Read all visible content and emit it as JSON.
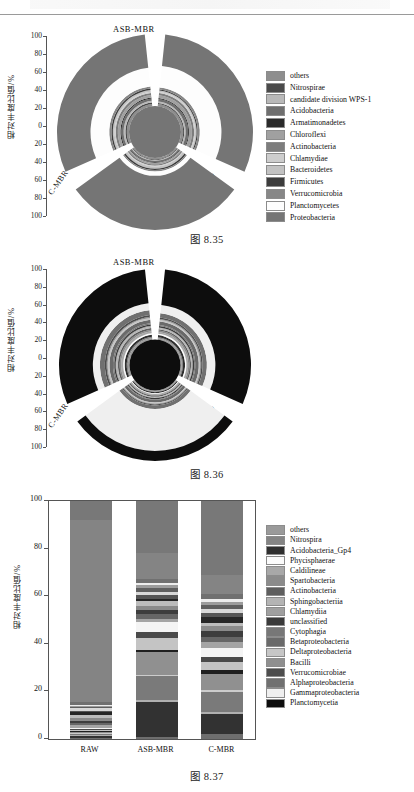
{
  "page": {
    "captions": {
      "fig1": "图 8.35",
      "fig2": "图 8.36",
      "fig3": "图 8.37"
    },
    "axis_title_cn": "相对丰度比值/%"
  },
  "chart_data": [
    {
      "id": "fig-8-35",
      "type": "pie",
      "subtype": "polar-stacked-rose",
      "title": "",
      "ylabel": "相对丰度比值/%",
      "ylim": [
        0,
        100
      ],
      "yticks": [
        "100",
        "80",
        "60",
        "40",
        "20",
        "0",
        "20",
        "40",
        "60",
        "80",
        "100"
      ],
      "sectors": [
        "ASB-MBR",
        "RAW",
        "C-MBR"
      ],
      "legend_position": "right",
      "categories": [
        "others",
        "Nitrospirae",
        "candidate division WPS-1",
        "Acidobacteria",
        "Armatimonadetes",
        "Chloroflexi",
        "Actinobacteria",
        "Chlamydiae",
        "Bacteroidetes",
        "Firmicutes",
        "Verrucomicrobia",
        "Planctomycetes",
        "Proteobacteria"
      ],
      "colors": [
        "#8e8e8e",
        "#4a4a4a",
        "#b9b9b9",
        "#6f6f6f",
        "#2a2a2a",
        "#a0a0a0",
        "#7d7d7d",
        "#cdcdcd",
        "#c2c2c2",
        "#3c3c3c",
        "#878787",
        "#fdfdfd",
        "#757575"
      ],
      "series": [
        {
          "name": "ASB-MBR",
          "values": [
            3.0,
            1.5,
            2.0,
            3.5,
            1.2,
            4.0,
            3.0,
            1.5,
            2.0,
            1.5,
            3.0,
            30.0,
            43.8
          ]
        },
        {
          "name": "RAW",
          "values": [
            2.0,
            1.0,
            1.0,
            2.0,
            0.8,
            2.0,
            2.0,
            1.0,
            3.0,
            2.0,
            2.0,
            6.0,
            75.2
          ]
        },
        {
          "name": "C-MBR",
          "values": [
            3.0,
            2.0,
            2.5,
            3.0,
            1.5,
            3.5,
            3.0,
            1.5,
            2.5,
            2.0,
            3.0,
            26.0,
            46.5
          ]
        }
      ]
    },
    {
      "id": "fig-8-36",
      "type": "pie",
      "subtype": "polar-stacked-rose",
      "title": "",
      "ylabel": "相对丰度比值/%",
      "ylim": [
        0,
        100
      ],
      "yticks": [
        "100",
        "80",
        "60",
        "40",
        "20",
        "0",
        "20",
        "40",
        "60",
        "80",
        "100"
      ],
      "sectors": [
        "ASB-MBR",
        "RAW",
        "C-MBR"
      ],
      "legend_position": "right",
      "categories": [
        "others",
        "Nitrospira",
        "Acidobacteria_Gp4",
        "Phycisphaerae",
        "Caldilineae",
        "Spartobacteria",
        "Actinobacteria",
        "Sphingobacteriia",
        "Chlamydiia",
        "unclassified",
        "Cytophagia",
        "Betaproteobacteria",
        "Deltaproteobacteria",
        "Bacilli",
        "Verrucomicrobiae",
        "Alphaproteobacteria",
        "Gammaproteobacteria",
        "Planctomycetia"
      ],
      "colors": [
        "#9a9a9a",
        "#848484",
        "#2f2f2f",
        "#fbfbfb",
        "#a8a8a8",
        "#8b8b8b",
        "#5e5e5e",
        "#b4b4b4",
        "#9f9f9f",
        "#3a3a3a",
        "#777777",
        "#6a6a6a",
        "#c6c6c6",
        "#8f8f8f",
        "#4d4d4d",
        "#707070",
        "#efefef",
        "#0d0d0d"
      ],
      "series": [
        {
          "name": "ASB-MBR",
          "values": [
            2.0,
            1.5,
            3.0,
            2.0,
            2.5,
            2.0,
            2.0,
            1.5,
            1.0,
            2.0,
            1.5,
            5.0,
            2.0,
            1.5,
            2.0,
            6.0,
            12.0,
            50.5
          ]
        },
        {
          "name": "RAW",
          "values": [
            1.5,
            1.0,
            1.5,
            1.0,
            1.5,
            1.0,
            1.5,
            1.0,
            0.8,
            1.5,
            1.0,
            4.0,
            1.5,
            1.2,
            1.5,
            5.0,
            60.0,
            14.5
          ]
        },
        {
          "name": "C-MBR",
          "values": [
            2.5,
            1.5,
            3.0,
            2.0,
            3.0,
            2.0,
            2.5,
            2.0,
            1.2,
            2.0,
            1.8,
            5.0,
            2.5,
            1.5,
            2.5,
            7.0,
            10.0,
            48.0
          ]
        }
      ]
    },
    {
      "id": "fig-8-37",
      "type": "bar",
      "subtype": "stacked-100",
      "title": "",
      "xlabel": "",
      "ylabel": "相对丰度比值/%",
      "ylim": [
        0,
        100
      ],
      "yticks": [
        "0",
        "20",
        "40",
        "60",
        "80",
        "100"
      ],
      "grid": false,
      "legend_position": "right",
      "categories": [
        "RAW",
        "ASB-MBR",
        "C-MBR"
      ],
      "legend_items": [
        "Terrimicrobium",
        "Aquisphaera",
        "Roseimicrobium",
        "Chryseolinea",
        "Planctopirus",
        "Planctomicrobium",
        "Rubinisphaera",
        "Reyranella",
        "Neochlamydia",
        "Enterococcus",
        "Blastopirellula",
        "Rhodoplanes",
        "Streptococcus",
        "Phreatobacter",
        "Aminobacter",
        "Hyphomicrobium",
        "Verrucomicrobium",
        "Gimesia",
        "Thermogutta",
        "Gemmata",
        "Pirellula",
        "unclassified",
        "Thiothrix",
        "others"
      ],
      "legend_italic": [
        true,
        true,
        true,
        true,
        true,
        true,
        true,
        true,
        true,
        true,
        true,
        true,
        true,
        true,
        true,
        true,
        true,
        true,
        true,
        true,
        true,
        true,
        true,
        false
      ],
      "colors": [
        "#6e6e6e",
        "#323232",
        "#b0b0b0",
        "#7a7a7a",
        "#cccccc",
        "#909090",
        "#1f1f1f",
        "#c4c4c4",
        "#4a4a4a",
        "#f4f4f4",
        "#a4a4a4",
        "#666666",
        "#3d3d3d",
        "#8a8a8a",
        "#bcbcbc",
        "#262626",
        "#555555",
        "#d8d8d8",
        "#5f5f5f",
        "#9c9c9c",
        "#ededed",
        "#707070",
        "#848484",
        "#787878"
      ],
      "series": [
        {
          "name": "RAW",
          "values": [
            0.6,
            0.5,
            0.4,
            0.5,
            0.4,
            0.5,
            0.4,
            0.5,
            0.4,
            0.5,
            1.2,
            0.8,
            1.0,
            1.4,
            1.2,
            1.0,
            0.8,
            1.0,
            0.6,
            0.5,
            0.4,
            1.0,
            77.0,
            8.0
          ]
        },
        {
          "name": "ASB-MBR",
          "values": [
            1.0,
            14.5,
            0.8,
            10.0,
            0.6,
            9.5,
            1.0,
            5.0,
            2.5,
            4.0,
            1.5,
            2.0,
            1.5,
            1.8,
            2.0,
            1.0,
            1.5,
            1.2,
            1.6,
            1.4,
            1.0,
            1.5,
            11.0,
            21.6
          ]
        },
        {
          "name": "C-MBR",
          "values": [
            2.0,
            8.5,
            1.0,
            8.0,
            1.2,
            6.5,
            1.5,
            3.5,
            2.0,
            4.0,
            2.5,
            2.0,
            2.5,
            2.0,
            1.5,
            2.5,
            1.5,
            1.5,
            1.8,
            1.5,
            1.2,
            1.8,
            8.0,
            31.0
          ]
        }
      ]
    }
  ]
}
